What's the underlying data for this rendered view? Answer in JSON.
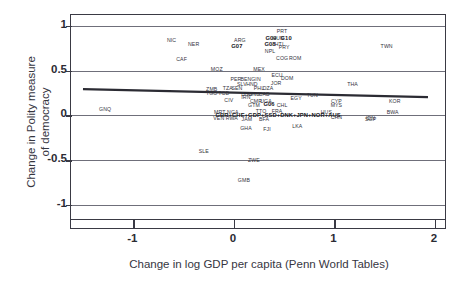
{
  "chart_data": {
    "type": "scatter",
    "title": "",
    "xlabel": "Change in log GDP per capita (Penn World Tables)",
    "ylabel": "Change in Polity measure\nof democracy",
    "xlim": [
      -1.62,
      2.12
    ],
    "ylim": [
      -1.18,
      1.12
    ],
    "xticks": [
      "-1",
      "0",
      "1",
      "2"
    ],
    "xtick_values": [
      -1,
      0,
      1,
      2
    ],
    "yticks": [
      "1",
      "0.5",
      "0",
      "-0.5",
      "-1"
    ],
    "ytick_values": [
      1,
      0.5,
      0,
      -0.5,
      -1
    ],
    "grid": true,
    "gridlines_y": [
      1,
      0.5,
      0,
      -0.5,
      -1
    ],
    "legend": "none",
    "marker_style": "text-labels",
    "fit_line": {
      "label": "linear fit",
      "color": "#2b2b33",
      "x0": -1.5,
      "y0": 0.285,
      "x1": 1.95,
      "y1": 0.195
    },
    "points": [
      {
        "label": "NIC",
        "x": -0.62,
        "y": 0.845
      },
      {
        "label": "NER",
        "x": -0.4,
        "y": 0.795
      },
      {
        "label": "CAF",
        "x": -0.52,
        "y": 0.625
      },
      {
        "label": "ARG",
        "x": 0.06,
        "y": 0.845
      },
      {
        "label": "G07",
        "x": 0.03,
        "y": 0.775,
        "bold": true
      },
      {
        "label": "PRT",
        "x": 0.48,
        "y": 0.945
      },
      {
        "label": "G09",
        "x": 0.37,
        "y": 0.86,
        "bold": true
      },
      {
        "label": "HUN",
        "x": 0.44,
        "y": 0.86
      },
      {
        "label": "G10",
        "x": 0.52,
        "y": 0.86,
        "bold": true
      },
      {
        "label": "G08",
        "x": 0.36,
        "y": 0.8,
        "bold": true
      },
      {
        "label": "HTI",
        "x": 0.45,
        "y": 0.8
      },
      {
        "label": "PRY",
        "x": 0.5,
        "y": 0.76
      },
      {
        "label": "NPL",
        "x": 0.36,
        "y": 0.715
      },
      {
        "label": "COG",
        "x": 0.48,
        "y": 0.645
      },
      {
        "label": "ROM",
        "x": 0.61,
        "y": 0.645
      },
      {
        "label": "TWN",
        "x": 1.52,
        "y": 0.775
      },
      {
        "label": "MOZ",
        "x": -0.17,
        "y": 0.512
      },
      {
        "label": "MEX",
        "x": 0.25,
        "y": 0.512
      },
      {
        "label": "ECU",
        "x": 0.43,
        "y": 0.455
      },
      {
        "label": "DOM",
        "x": 0.53,
        "y": 0.42
      },
      {
        "label": "PER",
        "x": 0.02,
        "y": 0.4
      },
      {
        "label": "BEN",
        "x": 0.12,
        "y": 0.4
      },
      {
        "label": "GIN",
        "x": 0.22,
        "y": 0.4
      },
      {
        "label": "SLV",
        "x": 0.08,
        "y": 0.355
      },
      {
        "label": "HND",
        "x": 0.18,
        "y": 0.355
      },
      {
        "label": "JOR",
        "x": 0.42,
        "y": 0.365
      },
      {
        "label": "THA",
        "x": 1.18,
        "y": 0.355
      },
      {
        "label": "ZMB",
        "x": -0.22,
        "y": 0.29
      },
      {
        "label": "TZA",
        "x": -0.06,
        "y": 0.3
      },
      {
        "label": "SEN",
        "x": 0.03,
        "y": 0.3
      },
      {
        "label": "PHL",
        "x": 0.25,
        "y": 0.305
      },
      {
        "label": "DZA",
        "x": 0.34,
        "y": 0.305
      },
      {
        "label": "TGO",
        "x": -0.22,
        "y": 0.248
      },
      {
        "label": "TCD",
        "x": -0.1,
        "y": 0.248
      },
      {
        "label": "BGD",
        "x": 0.13,
        "y": 0.243
      },
      {
        "label": "GNB",
        "x": 0.2,
        "y": 0.243
      },
      {
        "label": "CAB",
        "x": 0.3,
        "y": 0.243
      },
      {
        "label": "TUN",
        "x": 0.78,
        "y": 0.232
      },
      {
        "label": "IRN",
        "x": 0.12,
        "y": 0.2
      },
      {
        "label": "EGY",
        "x": 0.62,
        "y": 0.192
      },
      {
        "label": "CIV",
        "x": -0.05,
        "y": 0.17
      },
      {
        "label": "CMR",
        "x": 0.22,
        "y": 0.155
      },
      {
        "label": "UGA",
        "x": 0.32,
        "y": 0.155
      },
      {
        "label": "CYP",
        "x": 1.02,
        "y": 0.16
      },
      {
        "label": "KOR",
        "x": 1.6,
        "y": 0.155
      },
      {
        "label": "GTM",
        "x": 0.2,
        "y": 0.118
      },
      {
        "label": "G06",
        "x": 0.35,
        "y": 0.122,
        "bold": true
      },
      {
        "label": "CHL",
        "x": 0.48,
        "y": 0.118
      },
      {
        "label": "MYS",
        "x": 1.02,
        "y": 0.118
      },
      {
        "label": "GNQ",
        "x": -1.28,
        "y": 0.07
      },
      {
        "label": "MRT",
        "x": -0.14,
        "y": 0.042
      },
      {
        "label": "NGA",
        "x": -0.01,
        "y": 0.042
      },
      {
        "label": "TTO",
        "x": 0.27,
        "y": 0.048
      },
      {
        "label": "FRA",
        "x": 0.43,
        "y": 0.048
      },
      {
        "label": "HUS",
        "x": 0.92,
        "y": 0.042
      },
      {
        "label": "BWA",
        "x": 1.58,
        "y": 0.042
      },
      {
        "label": "GBR+CHE+GDP+SSD+DNK+JPN+NOR+AUS",
        "x": 0.44,
        "y": 0.008,
        "bold": true
      },
      {
        "label": "VEN",
        "x": -0.15,
        "y": -0.035
      },
      {
        "label": "RWA",
        "x": -0.02,
        "y": -0.035
      },
      {
        "label": "JAM",
        "x": 0.13,
        "y": -0.042
      },
      {
        "label": "BFA",
        "x": 0.3,
        "y": -0.045
      },
      {
        "label": "CHN",
        "x": 1.02,
        "y": -0.02
      },
      {
        "label": "IDN",
        "x": 1.36,
        "y": -0.028
      },
      {
        "label": "SGP",
        "x": 1.36,
        "y": -0.038
      },
      {
        "label": "GHA",
        "x": 0.12,
        "y": -0.14
      },
      {
        "label": "FJI",
        "x": 0.33,
        "y": -0.148
      },
      {
        "label": "LKA",
        "x": 0.63,
        "y": -0.115
      },
      {
        "label": "SLE",
        "x": -0.3,
        "y": -0.4
      },
      {
        "label": "ZWE",
        "x": 0.2,
        "y": -0.5
      },
      {
        "label": "GMB",
        "x": 0.1,
        "y": -0.72
      }
    ]
  }
}
